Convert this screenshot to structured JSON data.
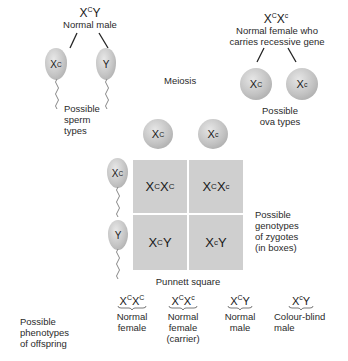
{
  "father": {
    "genotype_base": "X",
    "genotype_sup": "C",
    "genotype_rest": "Y",
    "label": "Normal male",
    "gametes": [
      {
        "base": "X",
        "sup": "C"
      },
      {
        "base": "Y",
        "sup": ""
      }
    ],
    "gametes_label_lines": [
      "Possible",
      "sperm",
      "types"
    ]
  },
  "mother": {
    "genotype": [
      {
        "base": "X",
        "sup": "C"
      },
      {
        "base": "X",
        "sup": "c"
      }
    ],
    "label_lines": [
      "Normal female who",
      "carries recessive gene"
    ],
    "gametes": [
      {
        "base": "X",
        "sup": "C"
      },
      {
        "base": "X",
        "sup": "c"
      }
    ],
    "gametes_label_lines": [
      "Possible",
      "ova types"
    ]
  },
  "process_label": "Meiosis",
  "punnett": {
    "title": "Punnett square",
    "col_headers": [
      {
        "base": "X",
        "sup": "C"
      },
      {
        "base": "X",
        "sup": "c"
      }
    ],
    "row_headers": [
      {
        "base": "X",
        "sup": "C"
      },
      {
        "base": "Y",
        "sup": ""
      }
    ],
    "cells": [
      [
        {
          "a": "X",
          "asup": "C",
          "b": "X",
          "bsup": "C"
        },
        {
          "a": "X",
          "asup": "C",
          "b": "X",
          "bsup": "c"
        }
      ],
      [
        {
          "a": "X",
          "asup": "C",
          "b": "Y",
          "bsup": ""
        },
        {
          "a": "X",
          "asup": "c",
          "b": "Y",
          "bsup": ""
        }
      ]
    ],
    "side_label_lines": [
      "Possible",
      "genotypes",
      "of zygotes",
      "(in boxes)"
    ]
  },
  "offspring": {
    "label_lines": [
      "Possible",
      "phenotypes",
      "of offspring"
    ],
    "items": [
      {
        "a": "X",
        "asup": "C",
        "b": "X",
        "bsup": "C",
        "lines": [
          "Normal",
          "female"
        ]
      },
      {
        "a": "X",
        "asup": "C",
        "b": "X",
        "bsup": "c",
        "lines": [
          "Normal",
          "female",
          "(carrier)"
        ]
      },
      {
        "a": "X",
        "asup": "C",
        "b": "Y",
        "bsup": "",
        "lines": [
          "Normal",
          "male"
        ]
      },
      {
        "a": "X",
        "asup": "c",
        "b": "Y",
        "bsup": "",
        "lines": [
          "Colour-blind",
          "male"
        ]
      }
    ]
  },
  "colors": {
    "cell_fill": "#cfcfcf",
    "gamete_fill": "#c2c2c2",
    "text": "#1a1a1a"
  }
}
